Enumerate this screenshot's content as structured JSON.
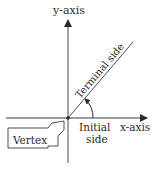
{
  "diagram": {
    "labels": {
      "y_axis": "y-axis",
      "x_axis": "x-axis",
      "terminal_side": "Terminal side",
      "initial_side_line1": "Initial",
      "initial_side_line2": "side",
      "vertex": "Vertex"
    },
    "colors": {
      "line": "#3a3a3a",
      "text": "#2a2a2a",
      "background": "#ffffff"
    }
  }
}
